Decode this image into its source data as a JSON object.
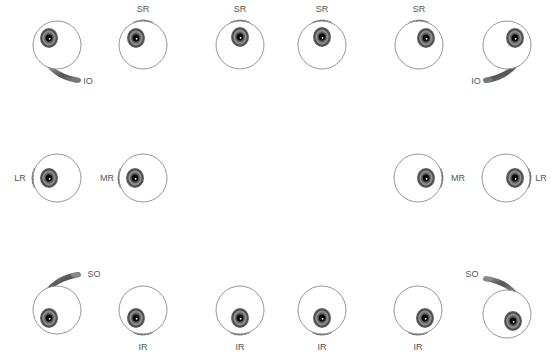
{
  "diagram": {
    "colors": {
      "outline": "#8a8a8a",
      "iris_dark": "#2a2a2a",
      "iris_mid": "#6e6e6e",
      "iris_light": "#a8a8a8",
      "muscle": "#7a7a7a",
      "label": "#555555"
    },
    "eyes": [
      {
        "id": "r1c1",
        "cx": 57,
        "cy": 45,
        "ix": 49,
        "iy": 38,
        "muscle": "IO",
        "muscle_pos": "bottom-right",
        "label": "IO",
        "lx": 88,
        "ly": 84
      },
      {
        "id": "r1c2",
        "cx": 143,
        "cy": 45,
        "ix": 136,
        "iy": 38,
        "muscle": "SR",
        "muscle_pos": "top",
        "label": "SR",
        "lx": 143,
        "ly": 12
      },
      {
        "id": "r1c3",
        "cx": 240,
        "cy": 45,
        "ix": 240,
        "iy": 37,
        "muscle": "SR",
        "muscle_pos": "top",
        "label": "SR",
        "lx": 240,
        "ly": 12
      },
      {
        "id": "r1c4",
        "cx": 322,
        "cy": 45,
        "ix": 322,
        "iy": 37,
        "muscle": "SR",
        "muscle_pos": "top",
        "label": "SR",
        "lx": 322,
        "ly": 12
      },
      {
        "id": "r1c5",
        "cx": 419,
        "cy": 45,
        "ix": 426,
        "iy": 38,
        "muscle": "SR",
        "muscle_pos": "top",
        "label": "SR",
        "lx": 419,
        "ly": 12
      },
      {
        "id": "r1c6",
        "cx": 507,
        "cy": 45,
        "ix": 515,
        "iy": 38,
        "muscle": "IO",
        "muscle_pos": "bottom-left",
        "label": "IO",
        "lx": 476,
        "ly": 84
      },
      {
        "id": "r2c1",
        "cx": 57,
        "cy": 178,
        "ix": 49,
        "iy": 178,
        "muscle": "LR",
        "muscle_pos": "left",
        "label": "LR",
        "lx": 20,
        "ly": 181
      },
      {
        "id": "r2c2",
        "cx": 143,
        "cy": 178,
        "ix": 135,
        "iy": 178,
        "muscle": "MR",
        "muscle_pos": "left",
        "label": "MR",
        "lx": 107,
        "ly": 181
      },
      {
        "id": "r2c3",
        "cx": 418,
        "cy": 178,
        "ix": 426,
        "iy": 178,
        "muscle": "MR",
        "muscle_pos": "right",
        "label": "MR",
        "lx": 458,
        "ly": 181
      },
      {
        "id": "r2c4",
        "cx": 506,
        "cy": 178,
        "ix": 515,
        "iy": 178,
        "muscle": "LR",
        "muscle_pos": "right",
        "label": "LR",
        "lx": 541,
        "ly": 181
      },
      {
        "id": "r3c1",
        "cx": 57,
        "cy": 310,
        "ix": 49,
        "iy": 318,
        "muscle": "SO",
        "muscle_pos": "top-right",
        "label": "SO",
        "lx": 94,
        "ly": 277
      },
      {
        "id": "r3c2",
        "cx": 143,
        "cy": 310,
        "ix": 136,
        "iy": 318,
        "muscle": "IR",
        "muscle_pos": "bottom",
        "label": "IR",
        "lx": 143,
        "ly": 350
      },
      {
        "id": "r3c3",
        "cx": 240,
        "cy": 310,
        "ix": 240,
        "iy": 318,
        "muscle": "IR",
        "muscle_pos": "bottom",
        "label": "IR",
        "lx": 240,
        "ly": 350
      },
      {
        "id": "r3c4",
        "cx": 322,
        "cy": 310,
        "ix": 322,
        "iy": 318,
        "muscle": "IR",
        "muscle_pos": "bottom",
        "label": "IR",
        "lx": 322,
        "ly": 350
      },
      {
        "id": "r3c5",
        "cx": 418,
        "cy": 310,
        "ix": 425,
        "iy": 318,
        "muscle": "IR",
        "muscle_pos": "bottom",
        "label": "IR",
        "lx": 418,
        "ly": 350
      },
      {
        "id": "r3c6",
        "cx": 507,
        "cy": 314,
        "ix": 513,
        "iy": 321,
        "muscle": "SO",
        "muscle_pos": "top-left",
        "label": "SO",
        "lx": 472,
        "ly": 277
      }
    ]
  }
}
